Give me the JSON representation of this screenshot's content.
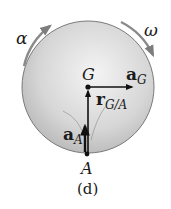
{
  "figure": {
    "caption": "(d)",
    "disk": {
      "center": [
        88,
        87
      ],
      "radius": 66,
      "fill_light": "#f2f2f2",
      "fill_dark": "#b5b5b5",
      "edge_color": "#7a7a7a"
    },
    "angular_acceleration": {
      "symbol": "α",
      "arrow_color": "#8a8a8a",
      "direction": "clockwise"
    },
    "angular_velocity": {
      "symbol": "ω",
      "arrow_color": "#8a8a8a",
      "direction": "clockwise"
    },
    "points": {
      "G": {
        "label": "G",
        "position": [
          88,
          87
        ]
      },
      "A": {
        "label": "A",
        "position": [
          88,
          153
        ]
      }
    },
    "vectors": {
      "a_G": {
        "symbol": "a",
        "subscript": "G",
        "from": [
          88,
          87
        ],
        "to": [
          133,
          87
        ]
      },
      "r_GA": {
        "symbol": "r",
        "subscript": "G/A",
        "from": [
          88,
          153
        ],
        "to": [
          88,
          90
        ]
      },
      "a_A": {
        "symbol": "a",
        "subscript": "A",
        "from": [
          88,
          153
        ],
        "to": [
          88,
          125
        ]
      }
    }
  }
}
